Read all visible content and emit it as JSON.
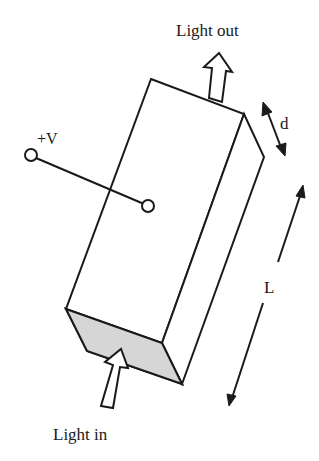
{
  "diagram": {
    "type": "electro-optic modulator crystal (3D rectangular block)",
    "labels": {
      "light_out": "Light out",
      "light_in": "Light in",
      "voltage": "+V",
      "thickness": "d",
      "length": "L"
    },
    "colors": {
      "stroke": "#1a1a1a",
      "end_face_fill": "#d6d6d6",
      "background": "#ffffff"
    }
  }
}
